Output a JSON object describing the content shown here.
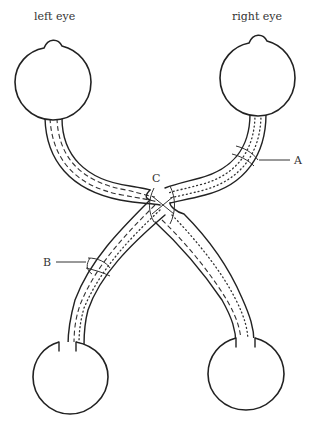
{
  "diagram": {
    "type": "visual pathway (optic chiasm)",
    "labels": {
      "left_eye": "left eye",
      "right_eye": "right eye",
      "A": "A",
      "B": "B",
      "C": "C"
    },
    "colors": {
      "stroke": "#222222",
      "background": "#ffffff"
    }
  }
}
